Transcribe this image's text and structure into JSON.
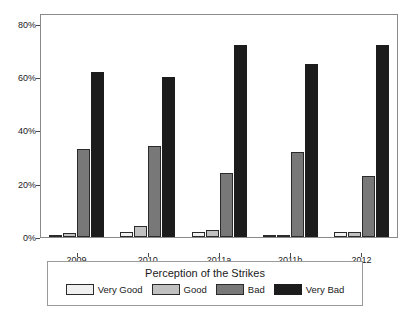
{
  "chart_data": {
    "type": "bar",
    "title": "",
    "xlabel": "",
    "ylabel": "",
    "categories": [
      "2009",
      "2010",
      "2011a",
      "2011b",
      "2012"
    ],
    "series": [
      {
        "name": "Very Good",
        "color": "#f0f0f0",
        "values": [
          0.8,
          1.8,
          1.8,
          0.8,
          1.8
        ]
      },
      {
        "name": "Good",
        "color": "#c0c0c0",
        "values": [
          1.6,
          4.0,
          2.8,
          0.8,
          1.8
        ]
      },
      {
        "name": "Bad",
        "color": "#787878",
        "values": [
          33,
          34,
          24,
          32,
          23
        ]
      },
      {
        "name": "Very Bad",
        "color": "#1c1c1c",
        "values": [
          62,
          60,
          72,
          65,
          72
        ]
      }
    ],
    "ylim": [
      0,
      84
    ],
    "yticks": [
      0,
      20,
      40,
      60,
      80
    ],
    "ytick_labels": [
      "0%",
      "20%",
      "40%",
      "60%",
      "80%"
    ],
    "grid": false,
    "legend_position": "bottom",
    "legend_title": "Perception of the Strikes"
  },
  "legend": {
    "title": "Perception of the Strikes",
    "entries": [
      {
        "label": "Very Good"
      },
      {
        "label": "Good"
      },
      {
        "label": "Bad"
      },
      {
        "label": "Very Bad"
      }
    ]
  }
}
